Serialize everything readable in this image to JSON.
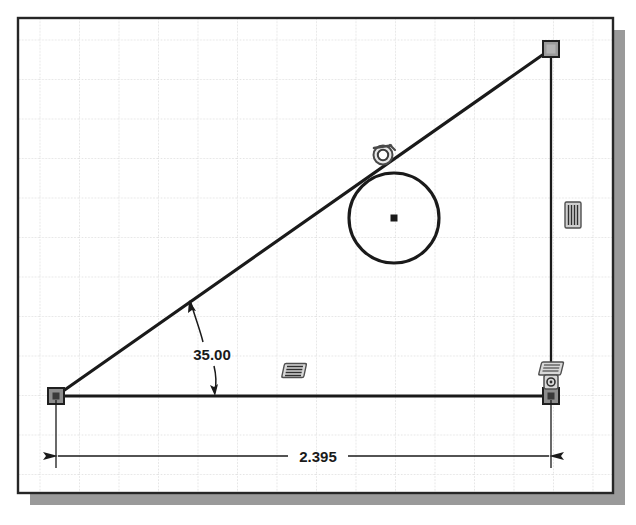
{
  "app": {
    "type": "cad-sketch-viewport",
    "background_color": "#ffffff",
    "paper_color": "#ffffff",
    "border_color": "#262626",
    "shadow_color": "#9a9a9a",
    "grid_color": "#c9c9c9",
    "geometry_color": "#1a1a1a",
    "constraint_color": "#555555",
    "grip_fill": "#9b9b9b",
    "grip_stroke": "#262626"
  },
  "viewport": {
    "name": "sketch-paper",
    "left": 18,
    "top": 18,
    "right": 613,
    "bottom": 493,
    "shadow_offset": 12,
    "grid_spacing": 39.5
  },
  "sketch": {
    "name": "angled-line-circle-sketch",
    "entities": [
      {
        "name": "horizontal-base-line",
        "type": "line",
        "x1": 56,
        "y1": 396,
        "x2": 551,
        "y2": 396,
        "style": "solid"
      },
      {
        "name": "inclined-line",
        "type": "line",
        "x1": 56,
        "y1": 396,
        "x2": 551,
        "y2": 49,
        "style": "solid"
      },
      {
        "name": "vertical-right-line",
        "type": "line",
        "x1": 551,
        "y1": 49,
        "x2": 551,
        "y2": 396,
        "style": "solid"
      },
      {
        "name": "tangent-circle",
        "type": "circle",
        "cx": 394,
        "cy": 218,
        "r": 45
      }
    ],
    "points": [
      {
        "name": "origin-point-bottom-left",
        "x": 56,
        "y": 396,
        "kind": "endpoint-grip-fixed"
      },
      {
        "name": "endpoint-top-right",
        "x": 551,
        "y": 49,
        "kind": "endpoint-grip"
      },
      {
        "name": "endpoint-bottom-right",
        "x": 551,
        "y": 396,
        "kind": "endpoint-grip-fixed"
      },
      {
        "name": "circle-center-point",
        "x": 394,
        "y": 218,
        "kind": "center-point"
      }
    ]
  },
  "constraints": [
    {
      "name": "tangent-constraint",
      "icon": "tangent-icon",
      "x": 383,
      "y": 155,
      "label": "Tangent"
    },
    {
      "name": "horizontal-constraint-base",
      "icon": "horizontal-icon",
      "x": 294,
      "y": 371,
      "label": "Horizontal"
    },
    {
      "name": "vertical-constraint-right",
      "icon": "vertical-icon",
      "x": 573,
      "y": 215,
      "label": "Vertical"
    },
    {
      "name": "horizontal-constraint-corner",
      "icon": "horizontal-icon",
      "x": 551,
      "y": 370,
      "label": "Horizontal"
    },
    {
      "name": "coincident-constraint-corner",
      "icon": "coincident-icon",
      "x": 551,
      "y": 383,
      "label": "Coincident"
    }
  ],
  "dimensions": [
    {
      "name": "angular-dimension",
      "type": "angular",
      "value": "35.00",
      "text_x": 212,
      "text_y": 355,
      "arc_cx": 56,
      "arc_cy": 396,
      "arc_r": 163,
      "start_angle_deg": 0,
      "end_angle_deg": 35
    },
    {
      "name": "linear-dimension-horizontal",
      "type": "linear",
      "value": "2.395",
      "text_x": 318,
      "text_y": 456,
      "line_y": 456,
      "x1": 56,
      "x2": 551,
      "ext_top": 396
    }
  ]
}
